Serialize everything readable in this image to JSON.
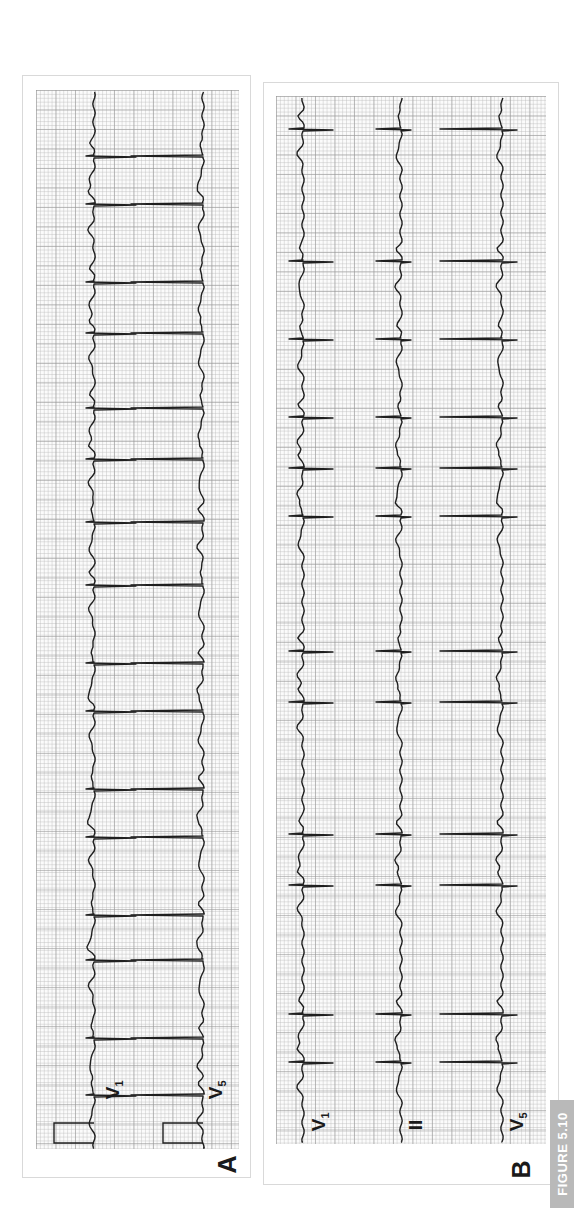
{
  "figure": {
    "label": "FIGURE 5.10",
    "badge_color": "#b9b9b9",
    "trace_color": "#1f1f1f",
    "grid_color": "#bdbdbd"
  },
  "panels": [
    {
      "letter": "A",
      "leads": [
        {
          "name": "V",
          "sub": "1"
        },
        {
          "name": "V",
          "sub": "5"
        }
      ],
      "has_calibration_pulse": true
    },
    {
      "letter": "B",
      "leads": [
        {
          "name": "V",
          "sub": "1"
        },
        {
          "name": "II",
          "sub": ""
        },
        {
          "name": "V",
          "sub": "5"
        }
      ],
      "has_calibration_pulse": false
    }
  ],
  "chart_data": [
    {
      "type": "line",
      "title": "Panel A: ECG rhythm strip (rotated 90°)",
      "series": [
        {
          "name": "V1",
          "baseline_x": 94,
          "qrs_positions_y": [
            158,
            206,
            283,
            336,
            409,
            460,
            523,
            587,
            666,
            714,
            791,
            838,
            917,
            963,
            1041,
            1097
          ]
        },
        {
          "name": "V5",
          "baseline_x": 203,
          "qrs_positions_y": [
            158,
            206,
            283,
            336,
            409,
            460,
            523,
            587,
            666,
            714,
            791,
            838,
            917,
            963,
            1041,
            1097
          ]
        }
      ],
      "xlabel": "",
      "ylabel": "",
      "grid": true
    },
    {
      "type": "line",
      "title": "Panel B: ECG rhythm strip (rotated 90°)",
      "series": [
        {
          "name": "V1",
          "baseline_x": 303,
          "qrs_positions_y": [
            130,
            263,
            340,
            419,
            469,
            518,
            652,
            703,
            836,
            886,
            1015,
            1063
          ]
        },
        {
          "name": "II",
          "baseline_x": 401,
          "qrs_positions_y": [
            130,
            263,
            340,
            419,
            469,
            518,
            652,
            703,
            836,
            886,
            1015,
            1063
          ]
        },
        {
          "name": "V5",
          "baseline_x": 502,
          "qrs_positions_y": [
            130,
            263,
            340,
            419,
            469,
            518,
            652,
            703,
            836,
            886,
            1015,
            1063
          ]
        }
      ],
      "xlabel": "",
      "ylabel": "",
      "grid": true
    }
  ]
}
